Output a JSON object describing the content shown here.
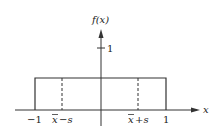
{
  "figure": {
    "y_axis_label": "f(x)",
    "x_axis_label": "x",
    "y_tick_label": "1",
    "x_tick_labels": {
      "left_bound": "−1",
      "lower_dashed": "x̅−s",
      "upper_dashed": "x̅+s",
      "right_bound": "1"
    },
    "lower_dashed_parts": {
      "xbar": "x",
      "rest": "−s"
    },
    "upper_dashed_parts": {
      "xbar": "x",
      "rest": "+s"
    }
  },
  "colors": {
    "line": "#333333",
    "background": "#ffffff"
  }
}
